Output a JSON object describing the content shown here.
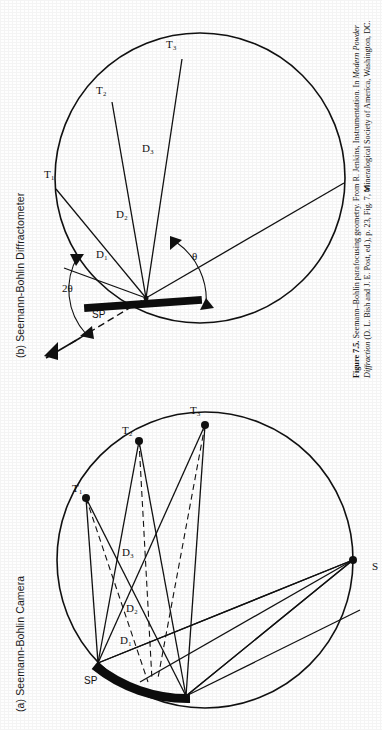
{
  "figure": {
    "number": "Figure 7.5.",
    "caption_line1": "Seemann–Bohlin parafocusing geometry. From R. Jenkins, Instrumentation. In ",
    "caption_italic1": "Modern Powder",
    "caption_line2": "Diffraction",
    "caption_line2_rest": " (D. L. Bish and J. E. Post, ed.), p. 23, Fig. 7, Mineralogical Society of America, Washington, DC."
  },
  "panels": [
    {
      "id": "a",
      "tag": "(a)",
      "title": "Seemann-Bohlin Camera",
      "labels": {
        "sample": "SP",
        "source": "S",
        "detectors": [
          "T₁",
          "T₂",
          "T₃"
        ],
        "distances": [
          "D₁",
          "D₂",
          "D₃"
        ]
      }
    },
    {
      "id": "b",
      "tag": "(b)",
      "title": "Seemann-Bohlin Diffractometer",
      "labels": {
        "sample": "SP",
        "source": "S",
        "detectors": [
          "T₁",
          "T₂",
          "T₃"
        ],
        "distances": [
          "D₁",
          "D₂",
          "D₃"
        ],
        "angle_theta": "θ",
        "angle_two_theta": "2θ"
      }
    }
  ],
  "colors": {
    "ink": "#111111",
    "paper": "#fefefe",
    "sample_fill": "#0d0d0d"
  }
}
